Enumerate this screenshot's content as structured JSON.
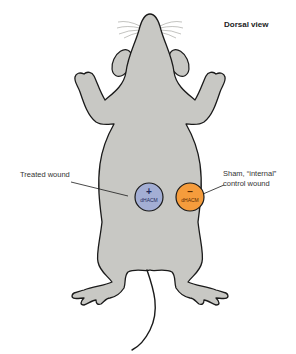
{
  "title": "Dorsal view",
  "labels": {
    "treated": "Treated wound",
    "sham_line1": "Sham, “internal”",
    "sham_line2": "control wound"
  },
  "wounds": [
    {
      "id": "treated",
      "sign": "+",
      "text": "dHACM",
      "color": "#a3aed4"
    },
    {
      "id": "control",
      "sign": "–",
      "text": "dHACM",
      "color": "#f59c3c"
    }
  ],
  "colors": {
    "body_fill": "#c8c8c4",
    "outline": "#1a1a1a",
    "whisker": "#9a9a96"
  }
}
